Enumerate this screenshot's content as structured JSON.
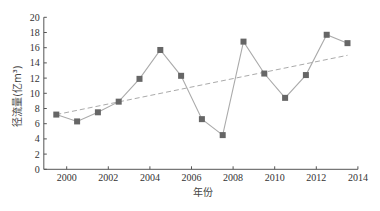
{
  "chart_data": {
    "type": "line",
    "title": "",
    "xlabel": "年份",
    "ylabel": "径流量(亿m³)",
    "xlim": [
      1998.9,
      2014
    ],
    "ylim": [
      0,
      20
    ],
    "xticks": [
      2000,
      2002,
      2004,
      2006,
      2008,
      2010,
      2012,
      2014
    ],
    "yticks": [
      0,
      2,
      4,
      6,
      8,
      10,
      12,
      14,
      16,
      18,
      20
    ],
    "grid": false,
    "legend": null,
    "series": [
      {
        "name": "径流量",
        "style": "solid line with square markers",
        "line_color": "#aaaaaa",
        "marker_color": "#666666",
        "x": [
          1999.5,
          2000.5,
          2001.5,
          2002.5,
          2003.5,
          2004.5,
          2005.5,
          2006.5,
          2007.5,
          2008.5,
          2009.5,
          2010.5,
          2011.5,
          2012.5,
          2013.5
        ],
        "values": [
          7.2,
          6.3,
          7.5,
          8.9,
          11.9,
          15.7,
          12.3,
          6.6,
          4.5,
          16.8,
          12.6,
          9.4,
          12.4,
          17.7,
          16.6
        ]
      },
      {
        "name": "线性趋势",
        "style": "dashed line",
        "line_color": "#aaaaaa",
        "x": [
          1999.5,
          2013.5
        ],
        "values": [
          7.2,
          15.0
        ]
      }
    ]
  }
}
